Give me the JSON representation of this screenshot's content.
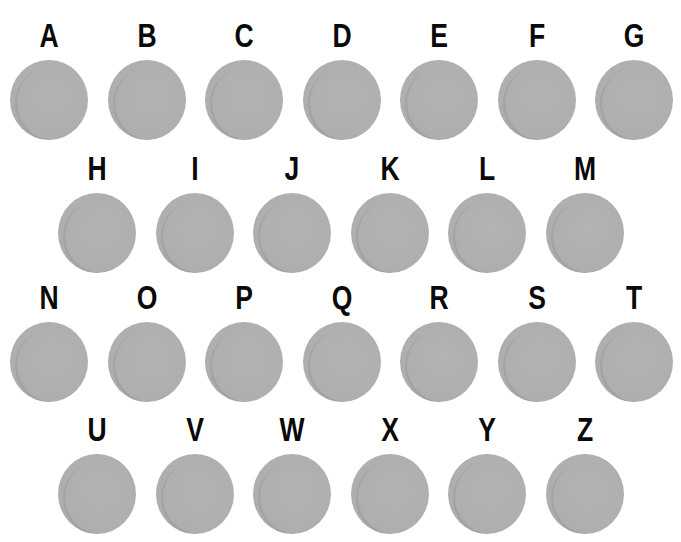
{
  "colors": {
    "background": "#ffffff",
    "disc": "#afafaf",
    "label": "#0a0a0a"
  },
  "rows": [
    {
      "items": [
        "A",
        "B",
        "C",
        "D",
        "E",
        "F",
        "G"
      ]
    },
    {
      "items": [
        "H",
        "I",
        "J",
        "K",
        "L",
        "M"
      ]
    },
    {
      "items": [
        "N",
        "O",
        "P",
        "Q",
        "R",
        "S",
        "T"
      ]
    },
    {
      "items": [
        "U",
        "V",
        "W",
        "X",
        "Y",
        "Z"
      ]
    }
  ]
}
